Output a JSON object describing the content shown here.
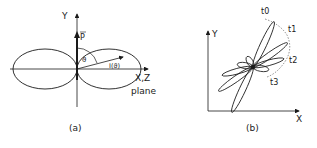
{
  "panel_a": {
    "y_axis_label": "Y",
    "vector_label": "P",
    "angle_label": "ϑ",
    "function_label": "I(ϑ)",
    "plane_label_line1": "X,Z",
    "plane_label_line2": "plane",
    "caption": "(a)"
  },
  "panel_b": {
    "y_axis_label": "Y",
    "x_axis_label": "X",
    "time_labels": [
      "t0",
      "t1",
      "t2",
      "t3"
    ],
    "caption": "(b)"
  },
  "colors": {
    "ink": "#1a1a1a",
    "background": "#ffffff"
  }
}
